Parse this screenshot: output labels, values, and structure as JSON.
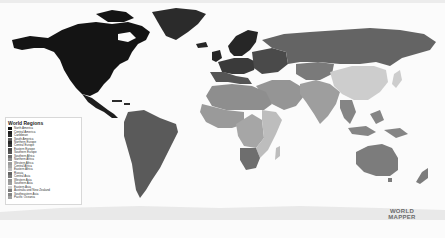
{
  "map": {
    "title": "World Regions",
    "background": "#fbfbfb",
    "ocean": "#fbfbfb"
  },
  "legend": {
    "title": "World Regions",
    "items": [
      {
        "label": "North America",
        "color": "#141414"
      },
      {
        "label": "Central America",
        "color": "#1e1e1e"
      },
      {
        "label": "Caribbean",
        "color": "#2c2c2c"
      },
      {
        "label": "South America",
        "color": "#5a5a5a"
      },
      {
        "label": "Northern Europe",
        "color": "#262626"
      },
      {
        "label": "Central Europe",
        "color": "#3a3a3a"
      },
      {
        "label": "Eastern Europe",
        "color": "#4a4a4a"
      },
      {
        "label": "Southern Europe",
        "color": "#555555"
      },
      {
        "label": "Southern Africa",
        "color": "#6e6e6e"
      },
      {
        "label": "Northern Africa",
        "color": "#8e8e8e"
      },
      {
        "label": "Western Africa",
        "color": "#9a9a9a"
      },
      {
        "label": "Central Africa",
        "color": "#a6a6a6"
      },
      {
        "label": "Eastern Africa",
        "color": "#bdbdbd"
      },
      {
        "label": "Russia",
        "color": "#646464"
      },
      {
        "label": "Central Asia",
        "color": "#7a7a7a"
      },
      {
        "label": "Western Asia",
        "color": "#959595"
      },
      {
        "label": "Southern Asia",
        "color": "#9e9e9e"
      },
      {
        "label": "Eastern Asia",
        "color": "#cdcdcd"
      },
      {
        "label": "Australia and New Zealand",
        "color": "#7c7c7c"
      },
      {
        "label": "Southeastern Asia",
        "color": "#858585"
      },
      {
        "label": "Pacific Oceania",
        "color": "#a0a0a0"
      }
    ]
  },
  "logo": {
    "line1": "WORLD",
    "line2": "MAPPER"
  }
}
